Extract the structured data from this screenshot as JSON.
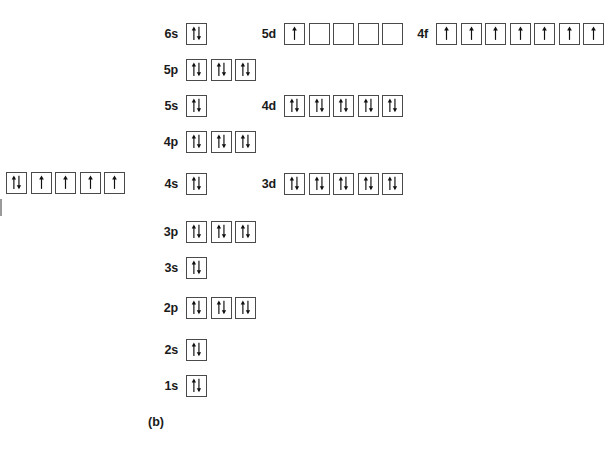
{
  "figure": {
    "caption": "(b)",
    "box_border_color": "#4a4a4a",
    "arrow_color": "#111111",
    "background": "#ffffff"
  },
  "partial_row": {
    "name": "left-partial-orbital-row",
    "label": "",
    "boxes": [
      "updown",
      "up",
      "up",
      "up",
      "up"
    ]
  },
  "rows": [
    {
      "id": "row-6s-5d-4f",
      "groups": [
        {
          "label": "6s",
          "boxes": [
            "updown"
          ]
        },
        {
          "label": "5d",
          "boxes": [
            "up",
            "empty",
            "empty",
            "empty",
            "empty"
          ]
        },
        {
          "label": "4f",
          "boxes": [
            "up",
            "up",
            "up",
            "up",
            "up",
            "up",
            "up"
          ]
        }
      ]
    },
    {
      "id": "row-5p",
      "groups": [
        {
          "label": "5p",
          "boxes": [
            "updown",
            "updown",
            "updown"
          ]
        }
      ]
    },
    {
      "id": "row-5s-4d",
      "groups": [
        {
          "label": "5s",
          "boxes": [
            "updown"
          ]
        },
        {
          "label": "4d",
          "boxes": [
            "updown",
            "updown",
            "updown",
            "updown",
            "updown"
          ]
        }
      ]
    },
    {
      "id": "row-4p",
      "groups": [
        {
          "label": "4p",
          "boxes": [
            "updown",
            "updown",
            "updown"
          ]
        }
      ]
    },
    {
      "id": "row-4s-3d",
      "groups": [
        {
          "label": "4s",
          "boxes": [
            "updown"
          ]
        },
        {
          "label": "3d",
          "boxes": [
            "updown",
            "updown",
            "updown",
            "updown",
            "updown"
          ]
        }
      ]
    },
    {
      "id": "row-3p",
      "groups": [
        {
          "label": "3p",
          "boxes": [
            "updown",
            "updown",
            "updown"
          ]
        }
      ]
    },
    {
      "id": "row-3s",
      "groups": [
        {
          "label": "3s",
          "boxes": [
            "updown"
          ]
        }
      ]
    },
    {
      "id": "row-2p",
      "groups": [
        {
          "label": "2p",
          "boxes": [
            "updown",
            "updown",
            "updown"
          ]
        }
      ]
    },
    {
      "id": "row-2s",
      "groups": [
        {
          "label": "2s",
          "boxes": [
            "updown"
          ]
        }
      ]
    },
    {
      "id": "row-1s",
      "groups": [
        {
          "label": "1s",
          "boxes": [
            "updown"
          ]
        }
      ]
    }
  ],
  "layout": {
    "row_tops": [
      22,
      58,
      94,
      130,
      172,
      220,
      256,
      296,
      338,
      374
    ],
    "label_right_edges": {
      "s_p": 178,
      "d": 276,
      "f": 428
    }
  }
}
